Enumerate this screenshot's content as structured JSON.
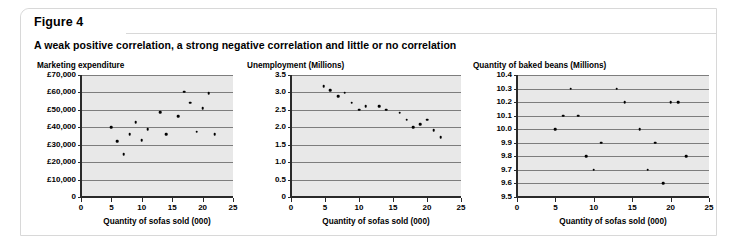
{
  "figure": {
    "tab_label": "Figure 4",
    "subtitle": "A weak positive correlation, a strong negative correlation and little or no correlation"
  },
  "colors": {
    "plot_background": "#e8e8e8",
    "gridline": "#7d7d7d",
    "axis": "#2a2a2a",
    "point": "#000000",
    "panel_border": "#d8d8d8",
    "page_background": "#ffffff"
  },
  "shared": {
    "xlabel": "Quantity of sofas sold (000)",
    "xticks": [
      "0",
      "5",
      "10",
      "15",
      "20",
      "25"
    ],
    "xlim": [
      0,
      25
    ]
  },
  "chart_data": [
    {
      "type": "scatter",
      "title": "Marketing expenditure",
      "xlabel": "Quantity of sofas sold (000)",
      "ylabel": "Marketing expenditure",
      "correlation": "weak positive",
      "xlim": [
        0,
        25
      ],
      "ylim": [
        0,
        70000
      ],
      "grid": true,
      "legend": "none",
      "xticks": [
        0,
        5,
        10,
        15,
        20,
        25
      ],
      "xticklabels": [
        "0",
        "5",
        "10",
        "15",
        "20",
        "25"
      ],
      "yticks": [
        0,
        10000,
        20000,
        30000,
        40000,
        50000,
        60000,
        70000
      ],
      "yticklabels": [
        "0",
        "£10,000",
        "£20,000",
        "£30,000",
        "£40,000",
        "£50,000",
        "£60,000",
        "£70,000"
      ],
      "points": [
        {
          "x": 5.0,
          "y": 40000
        },
        {
          "x": 6.0,
          "y": 32000
        },
        {
          "x": 7.0,
          "y": 24500
        },
        {
          "x": 8.0,
          "y": 36000
        },
        {
          "x": 9.0,
          "y": 43000
        },
        {
          "x": 10.0,
          "y": 32500
        },
        {
          "x": 11.0,
          "y": 39000
        },
        {
          "x": 13.0,
          "y": 48500
        },
        {
          "x": 14.0,
          "y": 36000
        },
        {
          "x": 16.0,
          "y": 46500
        },
        {
          "x": 17.0,
          "y": 60500
        },
        {
          "x": 18.0,
          "y": 54000
        },
        {
          "x": 19.0,
          "y": 37500
        },
        {
          "x": 20.0,
          "y": 51000
        },
        {
          "x": 21.0,
          "y": 59500
        },
        {
          "x": 22.0,
          "y": 36000
        }
      ]
    },
    {
      "type": "scatter",
      "title": "Unemployment (Millions)",
      "xlabel": "Quantity of sofas sold (000)",
      "ylabel": "Unemployment (Millions)",
      "correlation": "strong negative",
      "xlim": [
        0,
        25
      ],
      "ylim": [
        0,
        3.5
      ],
      "grid": true,
      "legend": "none",
      "xticks": [
        0,
        5,
        10,
        15,
        20,
        25
      ],
      "xticklabels": [
        "0",
        "5",
        "10",
        "15",
        "20",
        "25"
      ],
      "yticks": [
        0,
        0.5,
        1.0,
        1.5,
        2.0,
        2.5,
        3.0,
        3.5
      ],
      "yticklabels": [
        "0",
        "0.5",
        "1.0",
        "1.5",
        "2.0",
        "2.5",
        "3.0",
        "3.5"
      ],
      "points": [
        {
          "x": 4.8,
          "y": 3.18
        },
        {
          "x": 5.8,
          "y": 3.07
        },
        {
          "x": 6.9,
          "y": 2.9
        },
        {
          "x": 7.9,
          "y": 2.99
        },
        {
          "x": 8.9,
          "y": 2.7
        },
        {
          "x": 10.0,
          "y": 2.5
        },
        {
          "x": 11.0,
          "y": 2.6
        },
        {
          "x": 13.0,
          "y": 2.6
        },
        {
          "x": 14.0,
          "y": 2.5
        },
        {
          "x": 16.0,
          "y": 2.42
        },
        {
          "x": 17.0,
          "y": 2.22
        },
        {
          "x": 18.0,
          "y": 2.0
        },
        {
          "x": 19.0,
          "y": 2.09
        },
        {
          "x": 20.0,
          "y": 2.22
        },
        {
          "x": 21.0,
          "y": 1.92
        },
        {
          "x": 22.0,
          "y": 1.71
        }
      ]
    },
    {
      "type": "scatter",
      "title": "Quantity of baked beans (Millions)",
      "xlabel": "Quantity of sofas sold (000)",
      "ylabel": "Quantity of baked beans (Millions)",
      "correlation": "little or none",
      "xlim": [
        0,
        25
      ],
      "ylim": [
        9.5,
        10.4
      ],
      "grid": true,
      "legend": "none",
      "xticks": [
        0,
        5,
        10,
        15,
        20,
        25
      ],
      "xticklabels": [
        "0",
        "5",
        "10",
        "15",
        "20",
        "25"
      ],
      "yticks": [
        9.5,
        9.6,
        9.7,
        9.8,
        9.9,
        10.0,
        10.1,
        10.2,
        10.3,
        10.4
      ],
      "yticklabels": [
        "9.5",
        "9.6",
        "9.7",
        "9.8",
        "9.9",
        "10.0",
        "10.1",
        "10.2",
        "10.3",
        "10.4"
      ],
      "points": [
        {
          "x": 5.0,
          "y": 10.0
        },
        {
          "x": 6.0,
          "y": 10.1
        },
        {
          "x": 7.0,
          "y": 10.3
        },
        {
          "x": 8.0,
          "y": 10.1
        },
        {
          "x": 9.0,
          "y": 9.8
        },
        {
          "x": 10.0,
          "y": 9.7
        },
        {
          "x": 11.0,
          "y": 9.9
        },
        {
          "x": 13.0,
          "y": 10.3
        },
        {
          "x": 14.0,
          "y": 10.2
        },
        {
          "x": 16.0,
          "y": 10.0
        },
        {
          "x": 17.0,
          "y": 9.7
        },
        {
          "x": 18.0,
          "y": 9.9
        },
        {
          "x": 19.0,
          "y": 9.6
        },
        {
          "x": 20.0,
          "y": 10.2
        },
        {
          "x": 21.0,
          "y": 10.2
        },
        {
          "x": 22.0,
          "y": 9.8
        }
      ]
    }
  ]
}
